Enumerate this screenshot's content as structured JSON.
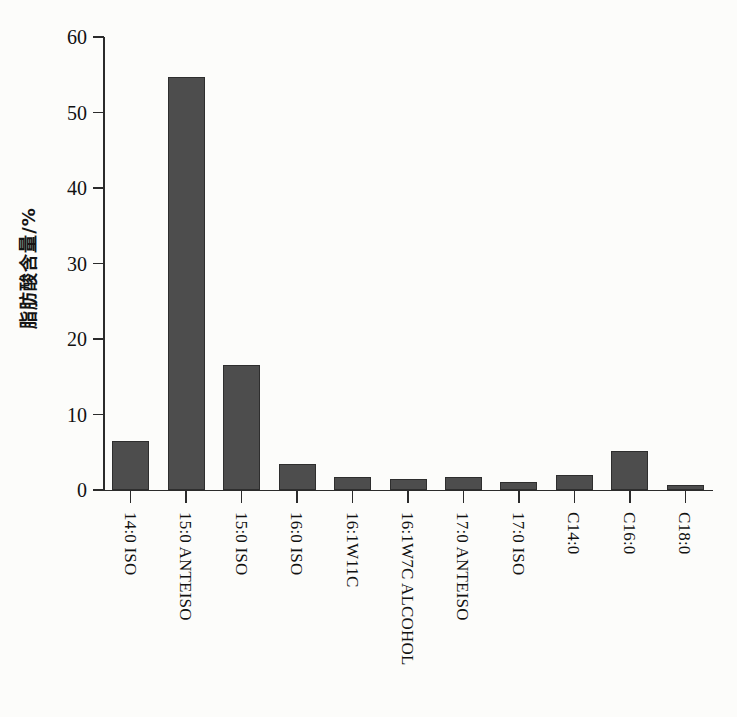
{
  "chart_data": {
    "type": "bar",
    "title": "",
    "subtitle": "",
    "xlabel": "",
    "ylabel": "脂肪酸含量/%",
    "ylim": [
      0,
      60
    ],
    "yticks": [
      0,
      10,
      20,
      30,
      40,
      50,
      60
    ],
    "ytick_labels": [
      "0",
      "10",
      "20",
      "30",
      "40",
      "50",
      "60"
    ],
    "grid": false,
    "legend": false,
    "legend_position": "none",
    "bar_color": "#4d4d4d",
    "bar_edge_color": "#2e2e2e",
    "background_color": "#fcfcfa",
    "axis_color": "#2b2b2b",
    "categories": [
      "14:0 ISO",
      "15:0 ANTEISO",
      "15:0 ISO",
      "16:0 ISO",
      "16:1W11C",
      "16:1W7C ALCOHOL",
      "17:0 ANTEISO",
      "17:0 ISO",
      "C14:0",
      "C16:0",
      "C18:0"
    ],
    "values": [
      6.5,
      54.7,
      16.6,
      3.4,
      1.7,
      1.4,
      1.7,
      1.1,
      2.0,
      5.2,
      0.7
    ]
  }
}
